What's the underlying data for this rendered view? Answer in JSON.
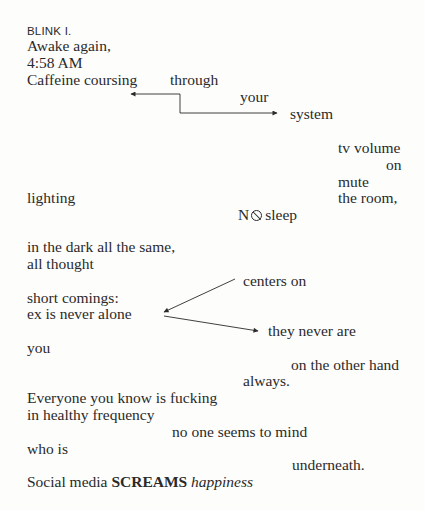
{
  "poem": {
    "title": "BLINK I.",
    "lines": {
      "awake": "Awake again,",
      "time": "4:58 AM",
      "caffeine": "Caffeine coursing",
      "through": "through",
      "your": "your",
      "system": "system",
      "tv_volume": "tv volume",
      "on": "on",
      "mute": "mute",
      "lighting": "lighting",
      "the_room": "the room,",
      "no_sleep_prefix": "N",
      "no_sleep_suffix": "sleep",
      "in_the_dark": "in the dark all the same,",
      "all_thought": "all thought",
      "centers_on": "centers on",
      "short_comings": "short comings:",
      "ex_alone": "ex is never alone",
      "they_never": "they never are",
      "you": "you",
      "other_hand": "on the other hand",
      "always": "always.",
      "everyone": "Everyone you know is fucking",
      "healthy": "in healthy frequency",
      "no_one": "no one seems to mind",
      "who_is": "who is",
      "underneath": "underneath.",
      "social_media": "Social media ",
      "screams": "SCREAMS",
      "happiness": "happiness"
    },
    "icons": {
      "no_sign": "prohibition-sign-icon"
    },
    "arrows": [
      {
        "name": "caffeine-arrow",
        "direction": "left",
        "from": [
          180,
          113
        ],
        "to": [
          130,
          94
        ]
      },
      {
        "name": "system-arrow",
        "direction": "right",
        "from": [
          180,
          94
        ],
        "to": [
          277,
          113
        ]
      },
      {
        "name": "centers-on-arrow",
        "direction": "down-left",
        "from": [
          235,
          279
        ],
        "to": [
          163,
          312
        ]
      },
      {
        "name": "they-never-arrow",
        "direction": "right",
        "from": [
          163,
          316
        ],
        "to": [
          258,
          331
        ]
      }
    ],
    "colors": {
      "ink": "#2a2a2a",
      "paper": "#fdfdfc"
    }
  }
}
